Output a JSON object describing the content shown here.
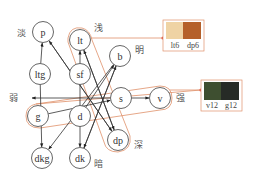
{
  "nodes": [
    {
      "id": "p",
      "label": "p"
    },
    {
      "id": "lt",
      "label": "lt"
    },
    {
      "id": "ltg",
      "label": "ltg"
    },
    {
      "id": "sf",
      "label": "sf"
    },
    {
      "id": "b",
      "label": "b"
    },
    {
      "id": "s",
      "label": "s"
    },
    {
      "id": "v",
      "label": "v"
    },
    {
      "id": "g",
      "label": "g"
    },
    {
      "id": "d",
      "label": "d"
    },
    {
      "id": "dp",
      "label": "dp"
    },
    {
      "id": "dkg",
      "label": "dkg"
    },
    {
      "id": "dk",
      "label": "dk"
    }
  ],
  "edges": [
    {
      "from": "ltg",
      "to": "p"
    },
    {
      "from": "dp",
      "to": "p"
    },
    {
      "from": "sf",
      "to": "lt"
    },
    {
      "from": "dp",
      "to": "lt"
    },
    {
      "from": "d",
      "to": "b"
    },
    {
      "from": "dk",
      "to": "b"
    },
    {
      "from": "g",
      "to": "s"
    },
    {
      "from": "s",
      "to": "v"
    },
    {
      "from": "lt",
      "to": "dp"
    },
    {
      "from": "p",
      "to": "dp"
    },
    {
      "from": "ltg",
      "to": "dkg"
    },
    {
      "from": "b",
      "to": "dkg"
    },
    {
      "from": "sf",
      "to": "dk"
    },
    {
      "from": "b",
      "to": "dk"
    }
  ],
  "labels": {
    "pale": "淡",
    "light": "浅",
    "bright": "明",
    "weak": "弱",
    "strong": "强",
    "deep": "深",
    "dark": "暗"
  },
  "swatches": [
    {
      "group": "lt-dp",
      "items": [
        {
          "label": "lt6",
          "color": "#efd3a4"
        },
        {
          "label": "dp6",
          "color": "#b5602a"
        }
      ]
    },
    {
      "group": "v-g",
      "items": [
        {
          "label": "v12",
          "color": "#3e4f30"
        },
        {
          "label": "g12",
          "color": "#262b26"
        }
      ]
    }
  ],
  "colors": {
    "highlight": "#e0906a",
    "connector_dot": "#e0574a"
  }
}
